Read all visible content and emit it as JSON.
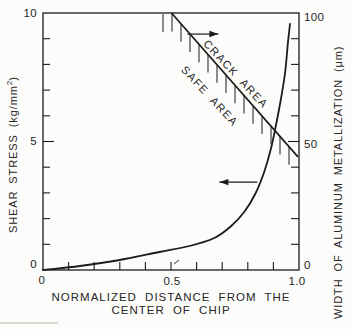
{
  "figure": {
    "background": "#fcfcfb",
    "ink": "#1b1b1b"
  },
  "chart_data": {
    "type": "line",
    "title": "",
    "xlabel_line1": "NORMALIZED DISTANCE FROM THE",
    "xlabel_line2": "CENTER OF CHIP",
    "ylabel_left": {
      "text_main": "SHEAR STRESS (kg/mm",
      "sup": "2",
      "text_close": ")"
    },
    "ylabel_right": "WIDTH OF ALUMINUM METALLIZATION (μm)",
    "x_axis": {
      "min": 0,
      "max": 1.0,
      "minor_tick_step": 0.1,
      "major_ticks": [
        0,
        0.5,
        1.0
      ]
    },
    "y_left_axis": {
      "min": 0,
      "max": 10,
      "minor_tick_step": 1,
      "major_ticks": [
        0,
        5,
        10
      ]
    },
    "y_right_axis": {
      "min": 0,
      "max": 100,
      "minor_tick_step": 10,
      "major_ticks": [
        0,
        50,
        100
      ]
    },
    "series": [
      {
        "name": "shear-stress-curve",
        "axis": "left",
        "points": [
          [
            0.0,
            0.0
          ],
          [
            0.144,
            0.156
          ],
          [
            0.3,
            0.389
          ],
          [
            0.455,
            0.7
          ],
          [
            0.572,
            0.934
          ],
          [
            0.669,
            1.245
          ],
          [
            0.735,
            1.712
          ],
          [
            0.786,
            2.257
          ],
          [
            0.829,
            2.957
          ],
          [
            0.864,
            3.813
          ],
          [
            0.891,
            4.747
          ],
          [
            0.911,
            5.681
          ],
          [
            0.93,
            6.693
          ],
          [
            0.946,
            7.704
          ],
          [
            0.957,
            8.872
          ],
          [
            0.965,
            9.572
          ]
        ]
      },
      {
        "name": "crack-boundary-line",
        "axis": "right",
        "points": [
          [
            0.502,
            100
          ],
          [
            0.996,
            44
          ]
        ],
        "hatched_side": "below"
      }
    ],
    "annotations": {
      "crack_label": {
        "text": "CRACK AREA",
        "x": 0.751,
        "y_left": 7.63,
        "rotation_deg": 47
      },
      "safe_label": {
        "text": "SAFE AREA",
        "x": 0.65,
        "y_left": 6.77,
        "rotation_deg": 47
      },
      "right_axis_arrow": {
        "points_to": "right",
        "x1": 0.564,
        "x2": 0.685,
        "y_left": 9.18
      },
      "left_axis_arrow": {
        "points_to": "left",
        "x1": 0.689,
        "x2": 0.837,
        "y_left": 3.42
      }
    }
  },
  "tick_labels": {
    "y_left": [
      "10",
      "5",
      "0"
    ],
    "y_right": [
      "100",
      "50",
      "0"
    ],
    "x": [
      "0",
      "0.5",
      "1.0"
    ]
  }
}
